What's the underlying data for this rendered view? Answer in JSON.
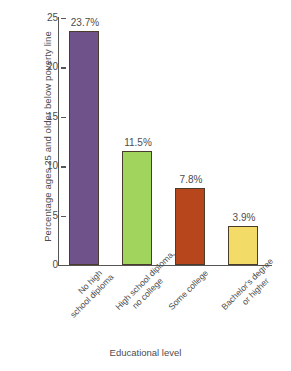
{
  "chart_data": {
    "type": "bar",
    "title": "",
    "xlabel": "Educational level",
    "ylabel": "Percentage ages 25 and older below poverty line",
    "categories": [
      "No high school diploma",
      "High school diploma, no college",
      "Some college",
      "Bachelor's degree or higher"
    ],
    "category_lines": [
      [
        "No high",
        "school diploma"
      ],
      [
        "High school diploma,",
        "no college"
      ],
      [
        "Some college",
        ""
      ],
      [
        "Bachelor's degree",
        "or higher"
      ]
    ],
    "values": [
      23.7,
      11.5,
      7.8,
      3.9
    ],
    "value_labels": [
      "23.7%",
      "11.5%",
      "7.8%",
      "3.9%"
    ],
    "bar_colors": [
      "#6e5289",
      "#a0d45c",
      "#b8461d",
      "#f2db66"
    ],
    "ylim": [
      0,
      25
    ],
    "yticks": [
      0,
      5,
      10,
      15,
      20,
      25
    ],
    "ytick_labels": [
      "0",
      "5",
      "10",
      "15",
      "20",
      "25"
    ],
    "grid": false,
    "legend": null
  }
}
